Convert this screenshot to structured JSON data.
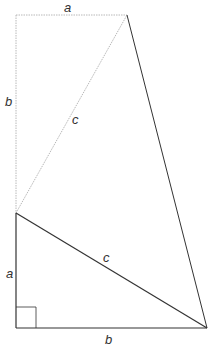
{
  "diagram": {
    "labels": {
      "top_a": "a",
      "left_b": "b",
      "upper_c": "c",
      "lower_c": "c",
      "left_a": "a",
      "bottom_b": "b"
    },
    "points": {
      "top_left": [
        16,
        15
      ],
      "top_right": [
        127,
        15
      ],
      "mid_left": [
        16,
        213
      ],
      "bottom_left": [
        16,
        328
      ],
      "bottom_right": [
        207,
        328
      ]
    },
    "colors": {
      "solid_line": "#333333",
      "dashed_line": "#b0b0b0",
      "label": "#333333"
    }
  }
}
